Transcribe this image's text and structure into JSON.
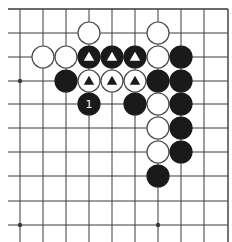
{
  "diagram": {
    "colors": {
      "background": "#ffffff",
      "line": "#3a3a3a",
      "black_stone": "#1a1a1a",
      "white_stone": "#ffffff",
      "white_stroke": "#4a4a4a",
      "marker_on_black": "#ffffff",
      "marker_on_white": "#1a1a1a"
    },
    "grid": {
      "columns_x": [
        20,
        43,
        66,
        89,
        112,
        135,
        158,
        181,
        204,
        228
      ],
      "rows_y": [
        9,
        33,
        57,
        81,
        104,
        128,
        152,
        176,
        201,
        225
      ],
      "left_extent": 8,
      "bottom_extent": 242,
      "top_edge": true,
      "right_edge": true
    },
    "star_points": [
      {
        "col": 0,
        "row": 3
      },
      {
        "col": 0,
        "row": 9
      },
      {
        "col": 6,
        "row": 9
      }
    ],
    "stone_radius": 11,
    "stones": [
      {
        "col": 3,
        "row": 1,
        "color": "white",
        "mark": ""
      },
      {
        "col": 6,
        "row": 1,
        "color": "white",
        "mark": ""
      },
      {
        "col": 1,
        "row": 2,
        "color": "white",
        "mark": ""
      },
      {
        "col": 2,
        "row": 2,
        "color": "white",
        "mark": ""
      },
      {
        "col": 3,
        "row": 2,
        "color": "black",
        "mark": "triangle"
      },
      {
        "col": 4,
        "row": 2,
        "color": "black",
        "mark": "triangle"
      },
      {
        "col": 5,
        "row": 2,
        "color": "black",
        "mark": "triangle"
      },
      {
        "col": 6,
        "row": 2,
        "color": "white",
        "mark": ""
      },
      {
        "col": 7,
        "row": 2,
        "color": "black",
        "mark": ""
      },
      {
        "col": 2,
        "row": 3,
        "color": "black",
        "mark": ""
      },
      {
        "col": 3,
        "row": 3,
        "color": "white",
        "mark": "triangle"
      },
      {
        "col": 4,
        "row": 3,
        "color": "white",
        "mark": "triangle"
      },
      {
        "col": 5,
        "row": 3,
        "color": "white",
        "mark": "triangle"
      },
      {
        "col": 6,
        "row": 3,
        "color": "black",
        "mark": ""
      },
      {
        "col": 7,
        "row": 3,
        "color": "black",
        "mark": ""
      },
      {
        "col": 3,
        "row": 4,
        "color": "black",
        "mark": "label",
        "label": "1"
      },
      {
        "col": 5,
        "row": 4,
        "color": "black",
        "mark": ""
      },
      {
        "col": 6,
        "row": 4,
        "color": "white",
        "mark": ""
      },
      {
        "col": 7,
        "row": 4,
        "color": "black",
        "mark": ""
      },
      {
        "col": 6,
        "row": 5,
        "color": "white",
        "mark": ""
      },
      {
        "col": 7,
        "row": 5,
        "color": "black",
        "mark": ""
      },
      {
        "col": 6,
        "row": 6,
        "color": "white",
        "mark": ""
      },
      {
        "col": 7,
        "row": 6,
        "color": "black",
        "mark": ""
      },
      {
        "col": 6,
        "row": 7,
        "color": "black",
        "mark": ""
      }
    ]
  }
}
